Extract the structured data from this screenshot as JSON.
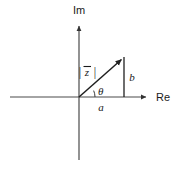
{
  "figure": {
    "kind": "argand-diagram",
    "background_color": "#ffffff",
    "stroke_color": "#333333",
    "text_color": "#1a1a1a"
  },
  "axes": {
    "imaginary": {
      "label": "Im",
      "label_x": 79,
      "label_y": 14,
      "arrow_tip_y": 22,
      "line_bottom_y": 160,
      "x": 79
    },
    "real": {
      "label": "Re",
      "label_x": 157,
      "label_y": 100,
      "arrow_tip_x": 150,
      "line_left_x": 10,
      "y": 97
    }
  },
  "origin": {
    "x": 79,
    "y": 97
  },
  "vector": {
    "label": "|z⃗|",
    "label_base": "z",
    "label_left_bar": "|",
    "label_right_bar": "|",
    "label_x": 90,
    "label_y": 72,
    "tip_x": 124,
    "tip_y": 57
  },
  "angle": {
    "label": "θ",
    "label_x": 99,
    "label_y": 94,
    "arc_radius": 16,
    "degrees": 23.5
  },
  "components": {
    "real_part": {
      "label": "a",
      "label_x": 100,
      "label_y": 110,
      "from_x": 79,
      "to_x": 124,
      "y": 97
    },
    "imaginary_part": {
      "label": "b",
      "label_x": 131,
      "label_y": 80,
      "x": 124,
      "from_y": 57,
      "to_y": 97
    }
  }
}
